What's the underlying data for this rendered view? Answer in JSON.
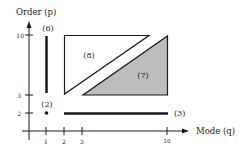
{
  "diagram": {
    "y_axis_label": "Order (p)",
    "x_axis_label": "Mode (q)",
    "y_ticks": [
      {
        "label": "10",
        "y": 35
      },
      {
        "label": "3",
        "y": 95
      },
      {
        "label": "2",
        "y": 113
      }
    ],
    "x_ticks": [
      {
        "label": "1",
        "x": 46
      },
      {
        "label": "2",
        "x": 64
      },
      {
        "label": "3",
        "x": 82
      },
      {
        "label": "10",
        "x": 167
      }
    ],
    "regions": {
      "r6": {
        "label": "(6)",
        "description": "vertical line at q=1, p from 3 to 10"
      },
      "r2": {
        "label": "(2)",
        "description": "point at q=1, p=2"
      },
      "r3": {
        "label": "(3)",
        "description": "horizontal line at p=2, q from 2 to 10"
      },
      "r8": {
        "label": "(8)",
        "description": "upper-left open triangle"
      },
      "r7": {
        "label": "(7)",
        "description": "lower-right shaded triangle"
      }
    },
    "colors": {
      "ink": "#1a1a1a",
      "shade": "#bdbdbd"
    }
  }
}
